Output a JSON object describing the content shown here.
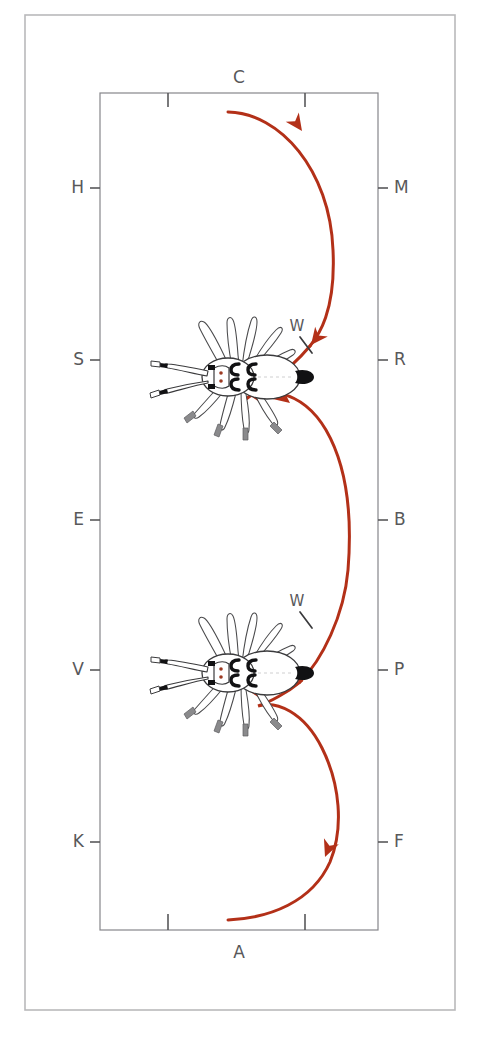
{
  "figure": {
    "type": "scientific-diagram",
    "background_color": "#ffffff"
  },
  "outer_frame": {
    "x": 25,
    "y": 15,
    "width": 430,
    "height": 995,
    "stroke": "#b9b9bb",
    "stroke_width": 1.6
  },
  "inner_rect": {
    "x": 100,
    "y": 93,
    "width": 278,
    "height": 837,
    "stroke": "#86868a",
    "stroke_width": 1.2
  },
  "labels": {
    "top": {
      "text": "C",
      "x": 239,
      "y": 83
    },
    "bottom": {
      "text": "A",
      "x": 239,
      "y": 958
    },
    "left": [
      {
        "text": "H",
        "x": 84,
        "y": 188
      },
      {
        "text": "S",
        "x": 84,
        "y": 360
      },
      {
        "text": "E",
        "x": 84,
        "y": 520
      },
      {
        "text": "V",
        "x": 84,
        "y": 670
      },
      {
        "text": "K",
        "x": 84,
        "y": 842
      }
    ],
    "right": [
      {
        "text": "M",
        "x": 394,
        "y": 188
      },
      {
        "text": "R",
        "x": 394,
        "y": 360
      },
      {
        "text": "B",
        "x": 394,
        "y": 520
      },
      {
        "text": "P",
        "x": 394,
        "y": 670
      },
      {
        "text": "F",
        "x": 394,
        "y": 842
      }
    ],
    "w_marks": [
      {
        "text": "W",
        "x": 297,
        "y": 331
      },
      {
        "text": "W",
        "x": 297,
        "y": 606
      }
    ]
  },
  "ticks": {
    "stroke": "#58585a",
    "top": [
      {
        "x": 168
      },
      {
        "x": 305
      }
    ],
    "bottom": [
      {
        "x": 168
      },
      {
        "x": 305
      }
    ],
    "left": [
      {
        "y": 188
      },
      {
        "y": 360
      },
      {
        "y": 520
      },
      {
        "y": 670
      },
      {
        "y": 842
      }
    ],
    "right": [
      {
        "y": 188
      },
      {
        "y": 360
      },
      {
        "y": 520
      },
      {
        "y": 670
      },
      {
        "y": 842
      }
    ]
  },
  "path": {
    "color": "#b33018",
    "stroke_width": 3.0,
    "description": "sinusoidal locomotion trajectory with four directional arrowheads",
    "arrowheads": [
      {
        "x": 300,
        "y": 130,
        "angle": 52
      },
      {
        "x": 313,
        "y": 345,
        "angle": 118
      },
      {
        "x": 287,
        "y": 404,
        "angle": 35
      },
      {
        "x": 300,
        "y": 681,
        "angle": 33
      },
      {
        "x": 322,
        "y": 855,
        "angle": 108
      }
    ]
  },
  "organisms": [
    {
      "id": "organism-1",
      "cx": 240,
      "cy": 377,
      "label": "dorsal-view arthropod"
    },
    {
      "id": "organism-2",
      "cx": 240,
      "cy": 673,
      "label": "dorsal-view arthropod"
    }
  ],
  "colors": {
    "trajectory_red": "#b33018",
    "frame_gray": "#b9b9bb",
    "rect_gray": "#86868a",
    "label_gray": "#58585a",
    "body_outline": "#3a3a3c",
    "leg_tip_gray": "#8d8d8f"
  }
}
